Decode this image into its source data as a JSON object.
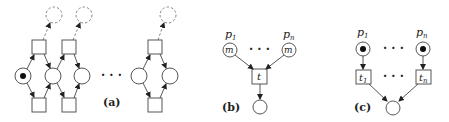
{
  "panels": {
    "a": {
      "caption": "(a)",
      "dots": "· · ·"
    },
    "b": {
      "caption": "(b)",
      "place_left_label": "p",
      "place_left_sub": "1",
      "place_right_label": "p",
      "place_right_sub": "n",
      "place_left_marking": "m",
      "place_right_marking": "m",
      "transition_label": "t",
      "dots": "· · ·"
    },
    "c": {
      "caption": "(c)",
      "place_left_label": "p",
      "place_left_sub": "1",
      "place_right_label": "p",
      "place_right_sub": "n",
      "transition_left_label": "t",
      "transition_left_sub": "1",
      "transition_right_label": "t",
      "transition_right_sub": "n",
      "dots_top": "· · ·",
      "dots_mid": "· · ·"
    }
  },
  "colors": {
    "stroke": "#444444",
    "token": "#111111",
    "dashed": "#777777"
  }
}
